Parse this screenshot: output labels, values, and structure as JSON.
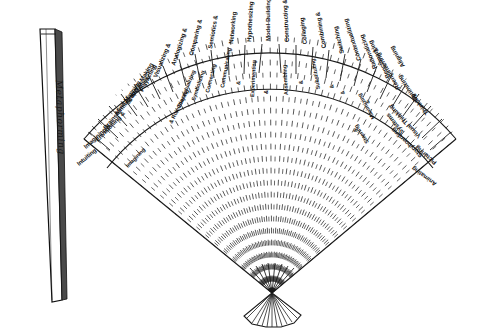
{
  "figure": {
    "closed_fan_label": "Metaphorming",
    "ink_color": "#1a1a1a",
    "background_color": "#ffffff",
    "style": "hand-drawn pen and ink line illustration",
    "hub_description": "pinched hub where all ribs converge",
    "rib_count": 30
  },
  "fan": {
    "ribs": [
      {
        "index": 0,
        "label": "Intuiting"
      },
      {
        "index": 1,
        "label": "Imagining &"
      },
      {
        "index": 2,
        "label": "Envisioning &"
      },
      {
        "index": 3,
        "label": "Imagining"
      },
      {
        "index": 4,
        "label": "Brainstorming & Games"
      },
      {
        "index": 5,
        "label": "Mind Mapping"
      },
      {
        "index": 6,
        "label": "Scenario-Making"
      },
      {
        "index": 7,
        "label": "Playacting"
      },
      {
        "index": 8,
        "label": "& Role-Playing"
      },
      {
        "index": 9,
        "label": "Visualizing &"
      },
      {
        "index": 10,
        "label": "Conceptualizing"
      },
      {
        "index": 11,
        "label": "Analogizing &"
      },
      {
        "index": 12,
        "label": "Symbolizing"
      },
      {
        "index": 13,
        "label": "Comparing &"
      },
      {
        "index": 14,
        "label": "Connecting"
      },
      {
        "index": 15,
        "label": "Semiotics &"
      },
      {
        "index": 16,
        "label": "Communicating"
      },
      {
        "index": 17,
        "label": "Networking"
      },
      {
        "index": 18,
        "label": "&"
      },
      {
        "index": 19,
        "label": "Hypothesizing &"
      },
      {
        "index": 20,
        "label": "Experimenting"
      },
      {
        "index": 21,
        "label": "Model-Building"
      },
      {
        "index": 22,
        "label": "&"
      },
      {
        "index": 23,
        "label": "Constructing &"
      },
      {
        "index": 24,
        "label": "Assembling"
      },
      {
        "index": 25,
        "label": "Collaging"
      },
      {
        "index": 26,
        "label": "&"
      },
      {
        "index": 27,
        "label": "Combining &"
      },
      {
        "index": 28,
        "label": "Substituting"
      },
      {
        "index": 29,
        "label": "Switching"
      },
      {
        "index": 30,
        "label": "&"
      },
      {
        "index": 31,
        "label": "Contextualizing"
      },
      {
        "index": 32,
        "label": "&"
      },
      {
        "index": 33,
        "label": "Rationalizing"
      },
      {
        "index": 34,
        "label": "Benchmarking"
      },
      {
        "index": 35,
        "label": "&"
      },
      {
        "index": 36,
        "label": "Reengineering &"
      },
      {
        "index": 37,
        "label": "Aligning"
      },
      {
        "index": 38,
        "label": "Maximizing"
      },
      {
        "index": 39,
        "label": "&"
      },
      {
        "index": 40,
        "label": "Steering"
      },
      {
        "index": 41,
        "label": "Optimizing"
      },
      {
        "index": 42,
        "label": "Systems"
      },
      {
        "index": 43,
        "label": "Thinking"
      },
      {
        "index": 44,
        "label": "Visual Thinking"
      },
      {
        "index": 45,
        "label": "Storyboarding"
      },
      {
        "index": 46,
        "label": "Picturing"
      },
      {
        "index": 47,
        "label": "Animating"
      }
    ],
    "band_labels": [
      "Intuiting",
      "Imagining &",
      "Envisioning & Imagining",
      "Brainstorming & Games",
      "Mind Mapping",
      "Scenario-Making",
      "Playacting & Role-Playing",
      "Visualizing & Conceptualizing",
      "Analogizing & Symbolizing",
      "Comparing & Connecting",
      "Semiotics & Communicating",
      "Networking",
      "Hypothesizing & Experimenting",
      "Model-Building",
      "Constructing & Assembling",
      "Collaging",
      "Combining & Substituting",
      "Switching & Contextualizing",
      "Rationalizing",
      "Benchmarking & Reengineering",
      "Maximizing & Steering",
      "Optimizing",
      "Aligning",
      "Systems Thinking",
      "Visual Thinking",
      "Storyboarding",
      "Picturing",
      "Animating"
    ]
  },
  "arc_labels": {
    "l0": "Intuiting",
    "l1": "Imagining &",
    "l2": "Envisioning &",
    "l3": "Imagining",
    "l4": "Brainstorming & Games",
    "l5": "Mind Mapping",
    "l6": "Scenario-Making",
    "l7": "Playacting",
    "l8": "& Role-Playing",
    "l9": "Visualizing &",
    "l10": "Conceptualizing",
    "l11": "Analogizing &",
    "l12": "Symbolizing",
    "l13": "Comparing &",
    "l14": "Connecting",
    "l15": "Semiotics &",
    "l16": "Communicating",
    "l17": "Networking",
    "l18": "&",
    "l19": "Hypothesizing &",
    "l20": "Experimenting",
    "l21": "Model-Building",
    "l22": "&",
    "l23": "Constructing &",
    "l24": "Assembling",
    "l25": "Collaging",
    "l26": "&",
    "l27": "Combining &",
    "l28": "Substituting",
    "l29": "Switching",
    "l30": "&",
    "l31": "Contextualizing",
    "l32": "&",
    "l33": "Rationalizing",
    "l34": "Benchmarking",
    "l35": "&",
    "l36": "Reengineering &",
    "l37": "Aligning",
    "l38": "Maximizing",
    "l39": "&",
    "l40": "Steering",
    "l41": "Optimizing",
    "l42": "Systems",
    "l43": "Thinking",
    "l44": "Visual Thinking",
    "l45": "Storyboarding",
    "l46": "Picturing",
    "l47": "Animating"
  }
}
